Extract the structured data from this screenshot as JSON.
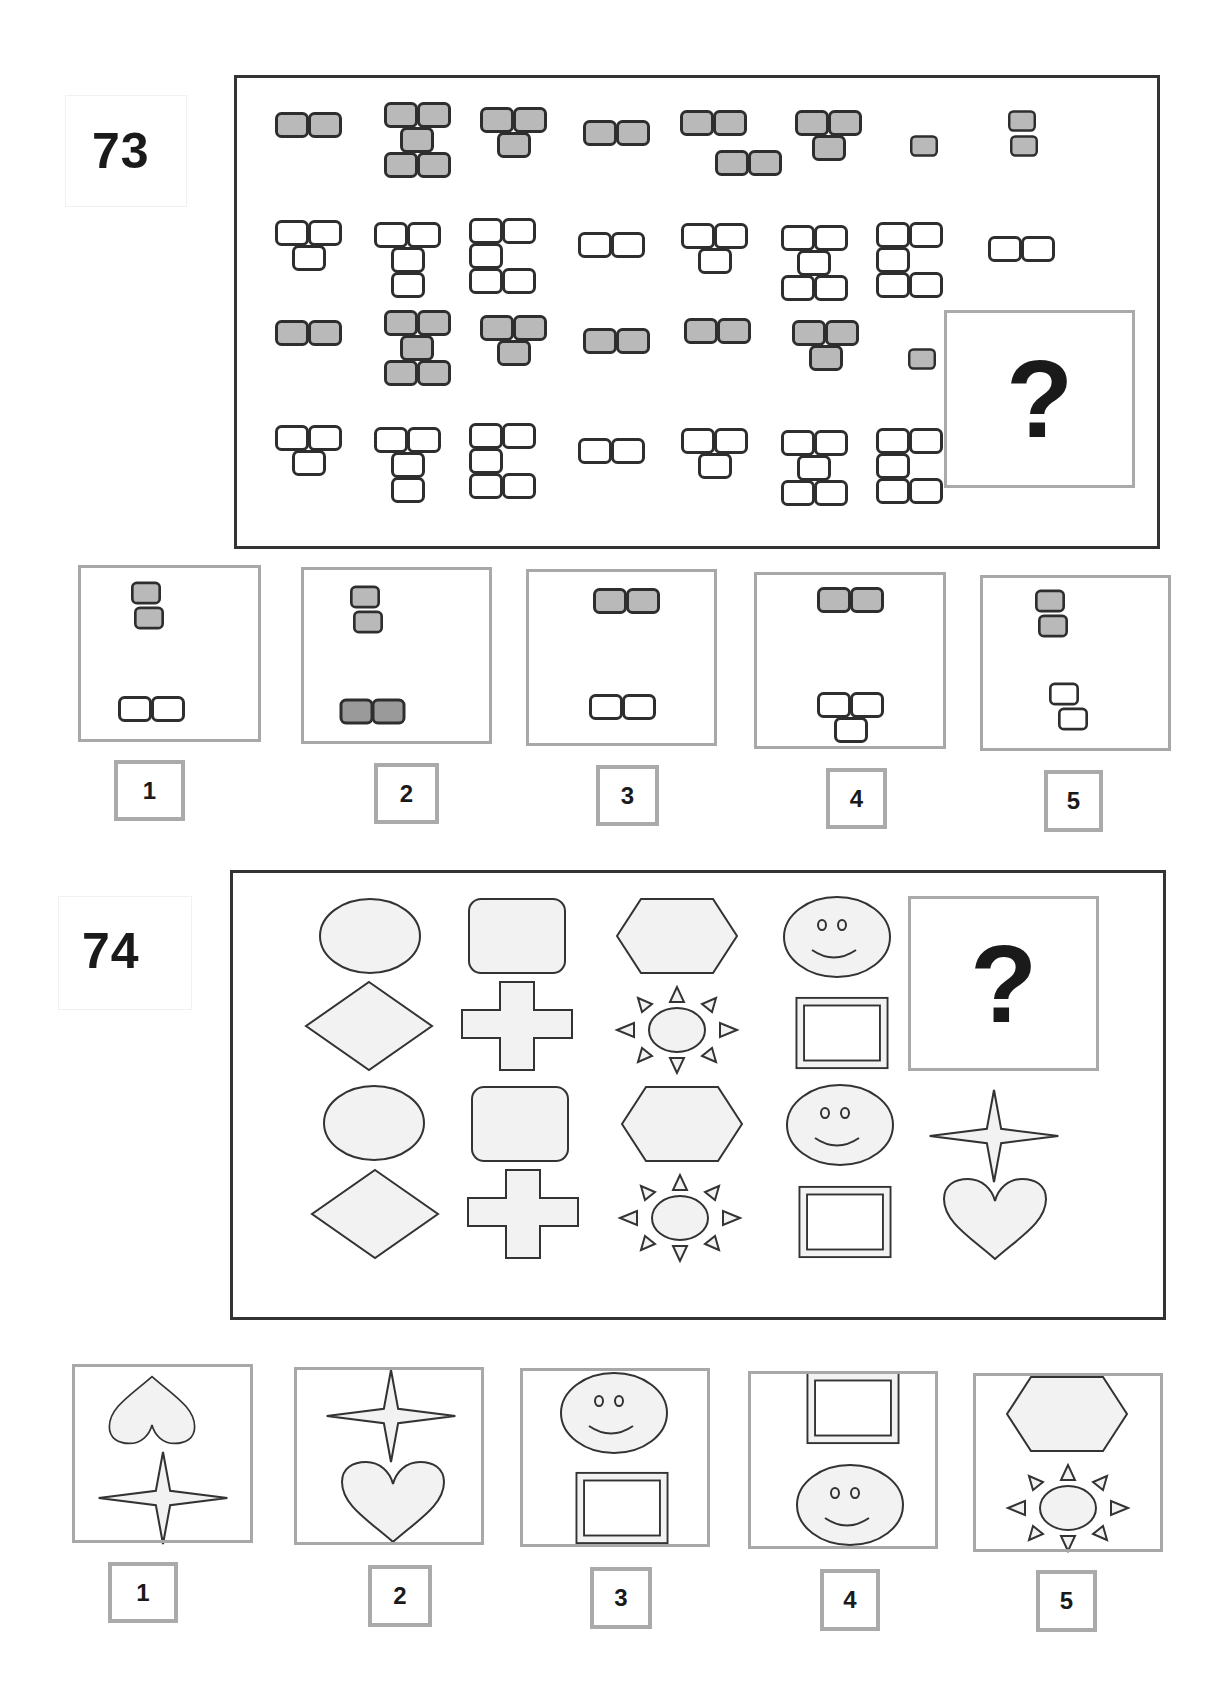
{
  "puzzle_73": {
    "number": "73",
    "question_mark": "?",
    "grid_description": "4 rows of block figures; rows 1 and 3 are grey-filled, rows 2 and 4 are white outlined; last cell of row 3 is the missing item",
    "rows": [
      {
        "fill": "grey",
        "figures": [
          "pair-horizontal",
          "h-shape",
          "t-shape",
          "pair-horizontal",
          "pair-split-offset",
          "t-shape",
          "single",
          "pair-vertical-offset"
        ]
      },
      {
        "fill": "white",
        "figures": [
          "t-shape",
          "t-long",
          "e-shape",
          "pair-horizontal",
          "t-shape",
          "h-shape",
          "e-shape",
          "pair-horizontal"
        ]
      },
      {
        "fill": "grey",
        "figures": [
          "pair-horizontal",
          "h-shape",
          "t-shape",
          "pair-horizontal",
          "pair-horizontal",
          "t-shape",
          "single",
          "missing"
        ]
      },
      {
        "fill": "white",
        "figures": [
          "t-shape",
          "t-long",
          "e-shape",
          "pair-horizontal",
          "t-shape",
          "h-shape",
          "e-shape"
        ]
      }
    ],
    "options": [
      {
        "label": "1",
        "top": "grey pair-vertical-offset",
        "bottom": "white pair-horizontal"
      },
      {
        "label": "2",
        "top": "grey pair-vertical-offset",
        "bottom": "dark-grey pair-horizontal"
      },
      {
        "label": "3",
        "top": "grey pair-horizontal",
        "bottom": "white pair-horizontal"
      },
      {
        "label": "4",
        "top": "grey pair-horizontal",
        "bottom": "white t-shape"
      },
      {
        "label": "5",
        "top": "grey pair-vertical-offset",
        "bottom": "white pair-vertical-offset"
      }
    ]
  },
  "puzzle_74": {
    "number": "74",
    "question_mark": "?",
    "rows": [
      [
        "circle",
        "rounded-rectangle",
        "hexagon",
        "smiley-face",
        "missing"
      ],
      [
        "diamond",
        "cross",
        "sun",
        "framed-square",
        "missing"
      ],
      [
        "circle",
        "rounded-rectangle",
        "hexagon",
        "smiley-face",
        "four-point-star"
      ],
      [
        "diamond",
        "cross",
        "sun",
        "framed-square",
        "heart"
      ]
    ],
    "options": [
      {
        "label": "1",
        "top": "heart-inverted",
        "bottom": "four-point-star"
      },
      {
        "label": "2",
        "top": "four-point-star",
        "bottom": "heart"
      },
      {
        "label": "3",
        "top": "smiley-face",
        "bottom": "framed-square"
      },
      {
        "label": "4",
        "top": "framed-square",
        "bottom": "smiley-face"
      },
      {
        "label": "5",
        "top": "hexagon",
        "bottom": "sun"
      }
    ]
  },
  "colors": {
    "block_fill": "#b9b9b9",
    "block_fill_dark": "#9a9a9a",
    "block_stroke": "#2e2e2e",
    "shape_fill": "#f2f2f2",
    "shape_stroke": "#333333",
    "frame_grey": "#aaaaaa",
    "main_border": "#333333"
  }
}
